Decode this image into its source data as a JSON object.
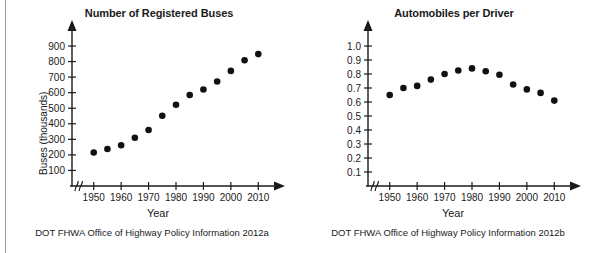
{
  "page": {
    "width": 592,
    "height": 253,
    "background": "#ffffff",
    "divider_color": "#9a9a9a"
  },
  "panels": [
    {
      "id": "buses",
      "title": "Number of Registered Buses",
      "ylabel": "Buses (thousands)",
      "xlabel": "Year",
      "source": "DOT FHWA Office of Highway Policy Information 2012a",
      "x_axis_var": "x",
      "y_axis_var": "y"
    },
    {
      "id": "autos",
      "title": "Automobiles per Driver",
      "ylabel": "Automobiles per licensed driver",
      "xlabel": "Year",
      "source": "DOT FHWA Office of Highway Policy Information 2012b",
      "x_axis_var": "x",
      "y_axis_var": "y"
    }
  ],
  "chart_data": [
    {
      "type": "scatter",
      "title": "Number of Registered Buses",
      "xlabel": "Year",
      "ylabel": "Buses (thousands)",
      "source": "DOT FHWA Office of Highway Policy Information 2012a",
      "grid": false,
      "legend": "none",
      "xlim": [
        1945,
        2015
      ],
      "ylim": [
        0,
        950
      ],
      "x_ticks": [
        1950,
        1960,
        1970,
        1980,
        1990,
        2000,
        2010
      ],
      "x_tick_labels": [
        "1950",
        "1960",
        "1970",
        "1980",
        "1990",
        "2000",
        "2010"
      ],
      "y_ticks": [
        100,
        200,
        300,
        400,
        500,
        600,
        700,
        800,
        900
      ],
      "y_tick_labels": [
        "100",
        "200",
        "300",
        "400",
        "500",
        "600",
        "700",
        "800",
        "900"
      ],
      "axis_break": true,
      "x": [
        1950,
        1955,
        1960,
        1965,
        1970,
        1975,
        1980,
        1985,
        1990,
        1995,
        2000,
        2005,
        2010
      ],
      "values": [
        215,
        238,
        262,
        310,
        360,
        452,
        522,
        585,
        620,
        672,
        740,
        808,
        848
      ],
      "marker": "filled-circle",
      "marker_color": "#111111"
    },
    {
      "type": "scatter",
      "title": "Automobiles per Driver",
      "xlabel": "Year",
      "ylabel": "Automobiles per licensed driver",
      "source": "DOT FHWA Office of Highway Policy Information 2012b",
      "grid": false,
      "legend": "none",
      "xlim": [
        1945,
        2015
      ],
      "ylim": [
        0,
        1.05
      ],
      "x_ticks": [
        1950,
        1960,
        1970,
        1980,
        1990,
        2000,
        2010
      ],
      "x_tick_labels": [
        "1950",
        "1960",
        "1970",
        "1980",
        "1990",
        "2000",
        "2010"
      ],
      "y_ticks": [
        0.1,
        0.2,
        0.3,
        0.4,
        0.5,
        0.6,
        0.7,
        0.8,
        0.9,
        1.0
      ],
      "y_tick_labels": [
        "0.1",
        "0.2",
        "0.3",
        "0.4",
        "0.5",
        "0.6",
        "0.7",
        "0.8",
        "0.9",
        "1.0"
      ],
      "axis_break": true,
      "x": [
        1950,
        1955,
        1960,
        1965,
        1970,
        1975,
        1980,
        1985,
        1990,
        1995,
        2000,
        2005,
        2010
      ],
      "values": [
        0.65,
        0.7,
        0.715,
        0.76,
        0.8,
        0.825,
        0.84,
        0.82,
        0.795,
        0.725,
        0.69,
        0.665,
        0.61
      ],
      "marker": "filled-circle",
      "marker_color": "#111111"
    }
  ]
}
